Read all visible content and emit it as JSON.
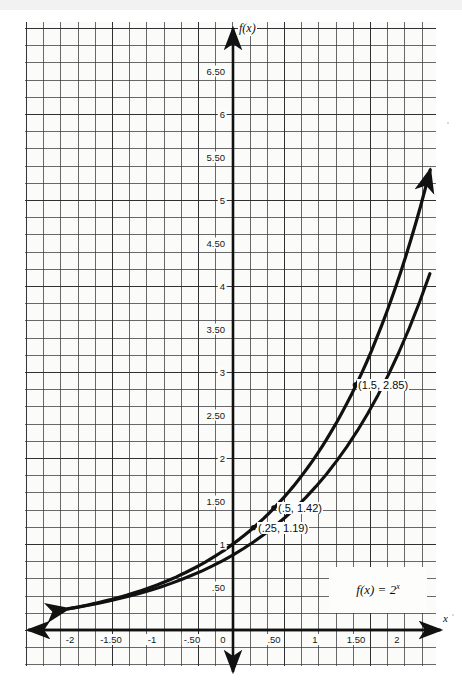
{
  "figure": {
    "kind": "graph-paper-plot",
    "background_color": "#fbfbfa",
    "ink_color": "#111111",
    "function_label": "f(x) = 2",
    "function_exponent": "x",
    "y_axis_label": "f(x)",
    "x_axis_label": "x"
  },
  "chart_data": {
    "type": "line",
    "title": "",
    "subtitle": "",
    "xlabel": "x",
    "ylabel": "f(x)",
    "equation": "f(x) = 2^x",
    "grid": true,
    "grid_minor_per_major": 5,
    "legend_position": "inside-bottom-right",
    "xlim": [
      -2.5,
      2.5
    ],
    "ylim": [
      0,
      6.9
    ],
    "x_ticks": [
      -2,
      -1.5,
      -1,
      -0.5,
      0,
      0.5,
      1,
      1.5,
      2
    ],
    "x_tick_labels": [
      "-2",
      "-1.50",
      "-1",
      "-.50",
      "0",
      ".50",
      "1",
      "1.50",
      "2"
    ],
    "y_ticks": [
      0.5,
      1,
      1.5,
      2,
      2.5,
      3,
      3.5,
      4,
      4.5,
      5,
      5.5,
      6,
      6.5
    ],
    "y_tick_labels": [
      ".50",
      "1",
      "1.50",
      "2",
      "2.50",
      "3",
      "3.50",
      "4",
      "4.50",
      "5",
      "5.50",
      "6",
      "6.50"
    ],
    "origin_label": "0",
    "series": [
      {
        "name": "f(x) = 2^x",
        "x": [
          -2.03,
          -1.75,
          -1.5,
          -1.25,
          -1,
          -0.75,
          -0.5,
          -0.25,
          0,
          0.25,
          0.5,
          0.75,
          1,
          1.25,
          1.5,
          1.75,
          2,
          2.25,
          2.45
        ],
        "values": [
          0.245,
          0.297,
          0.354,
          0.42,
          0.5,
          0.595,
          0.707,
          0.841,
          1.0,
          1.19,
          1.414,
          1.682,
          2.0,
          2.378,
          2.828,
          3.364,
          4.0,
          4.757,
          5.465
        ]
      }
    ],
    "annotations": [
      {
        "label": "(1.5, 2.85)",
        "x": 1.5,
        "y": 2.85,
        "marker": true
      },
      {
        "label": "(.5, 1.42)",
        "x": 0.5,
        "y": 1.42,
        "marker": true
      },
      {
        "label": "(.25, 1.19)",
        "x": 0.25,
        "y": 1.19,
        "marker": true
      }
    ],
    "arrowheads": [
      "start",
      "end"
    ]
  }
}
